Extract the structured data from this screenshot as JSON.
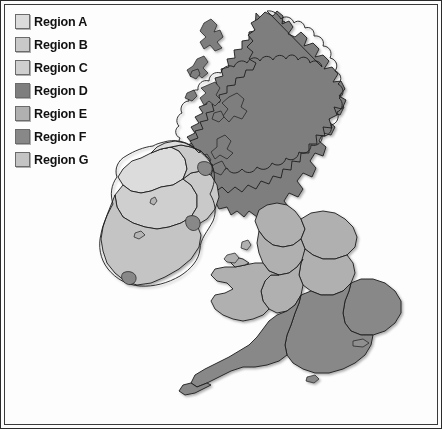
{
  "figure": {
    "kind": "choropleth-map",
    "background_color": "#fdfdfd",
    "border_color": "#2b2b2b",
    "outline_color": "#1d1d1d"
  },
  "legend": {
    "position": "top-left",
    "items": [
      {
        "id": "A",
        "label": "Region A",
        "color": "#dcdcdc"
      },
      {
        "id": "B",
        "label": "Region B",
        "color": "#c9c9c9"
      },
      {
        "id": "C",
        "label": "Region C",
        "color": "#cfcfcf"
      },
      {
        "id": "D",
        "label": "Region D",
        "color": "#7e7e7e"
      },
      {
        "id": "E",
        "label": "Region E",
        "color": "#b0b0b0"
      },
      {
        "id": "F",
        "label": "Region F",
        "color": "#888888"
      },
      {
        "id": "G",
        "label": "Region G",
        "color": "#c4c4c4"
      }
    ]
  },
  "map": {
    "areas": [
      {
        "name": "scotland",
        "region": "D",
        "color": "#7e7e7e"
      },
      {
        "name": "scottish-isles",
        "region": "D",
        "color": "#7e7e7e"
      },
      {
        "name": "northern-ireland",
        "region": "B",
        "color": "#c9c9c9"
      },
      {
        "name": "ireland-north-west",
        "region": "A",
        "color": "#dcdcdc"
      },
      {
        "name": "ireland-midlands",
        "region": "C",
        "color": "#cfcfcf"
      },
      {
        "name": "ireland-south",
        "region": "G",
        "color": "#c4c4c4"
      },
      {
        "name": "ireland-east",
        "region": "B",
        "color": "#c9c9c9"
      },
      {
        "name": "belfast-area",
        "region": "F",
        "color": "#888888"
      },
      {
        "name": "dublin-area",
        "region": "F",
        "color": "#888888"
      },
      {
        "name": "cork-area",
        "region": "F",
        "color": "#888888"
      },
      {
        "name": "north-england",
        "region": "E",
        "color": "#b0b0b0"
      },
      {
        "name": "yorkshire-humberside",
        "region": "E",
        "color": "#b0b0b0"
      },
      {
        "name": "north-west-england",
        "region": "E",
        "color": "#b0b0b0"
      },
      {
        "name": "east-midlands",
        "region": "E",
        "color": "#b0b0b0"
      },
      {
        "name": "west-midlands",
        "region": "E",
        "color": "#b0b0b0"
      },
      {
        "name": "wales",
        "region": "E",
        "color": "#b0b0b0"
      },
      {
        "name": "east-anglia",
        "region": "F",
        "color": "#888888"
      },
      {
        "name": "south-east-england",
        "region": "F",
        "color": "#888888"
      },
      {
        "name": "south-west-england",
        "region": "F",
        "color": "#888888"
      },
      {
        "name": "isle-of-man",
        "region": "E",
        "color": "#b0b0b0"
      },
      {
        "name": "anglesey",
        "region": "E",
        "color": "#b0b0b0"
      },
      {
        "name": "isle-of-wight",
        "region": "F",
        "color": "#888888"
      }
    ]
  }
}
